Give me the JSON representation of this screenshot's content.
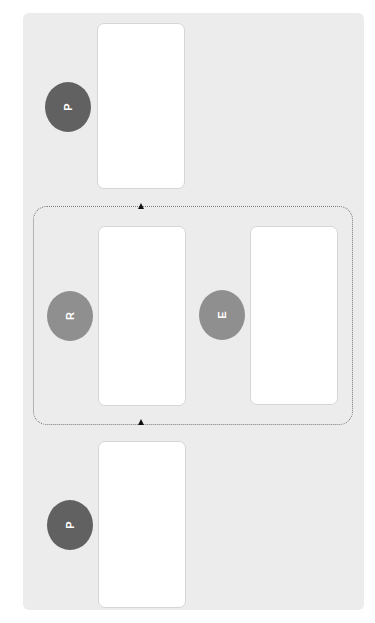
{
  "diagram": {
    "nodes": [
      {
        "id": "p-top",
        "label": "P",
        "shade": "dark"
      },
      {
        "id": "r",
        "label": "R",
        "shade": "medium"
      },
      {
        "id": "e",
        "label": "E",
        "shade": "medium"
      },
      {
        "id": "p-bottom",
        "label": "P",
        "shade": "dark"
      }
    ],
    "cards": [
      "",
      "",
      "",
      ""
    ],
    "loop": {
      "style": "dotted",
      "markers": [
        "up-arrow-top",
        "up-arrow-bottom"
      ]
    },
    "colors": {
      "background": "#ececec",
      "dark_node": "#616161",
      "medium_node": "#8f8f8f",
      "card": "#ffffff"
    }
  }
}
